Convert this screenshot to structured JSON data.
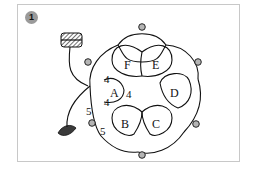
{
  "figure": {
    "step_number": "1",
    "rings": [
      {
        "label": "A"
      },
      {
        "label": "B"
      },
      {
        "label": "C"
      },
      {
        "label": "D"
      },
      {
        "label": "E"
      },
      {
        "label": "F"
      }
    ],
    "stitch_counts": {
      "ring_a_top": "4",
      "ring_a_right": "4",
      "ring_a_bottom": "4",
      "chain_left": "5",
      "chain_bottom": "5"
    },
    "colors": {
      "line": "#111111",
      "picot_fill": "#b5b5b5",
      "badge_fill": "#9a9a9a",
      "card_border": "#c8c8c8",
      "needle_fill": "#3a3a3a"
    }
  }
}
